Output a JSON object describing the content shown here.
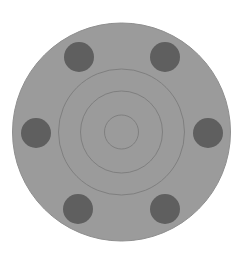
{
  "diagram": {
    "canvas": {
      "width": 243,
      "height": 258,
      "background": "#ffffff"
    },
    "disc": {
      "cx": 121.5,
      "cy": 132,
      "r": 109,
      "fill": "#9b9b9b",
      "stroke": "#8f8f8f"
    },
    "rings": [
      {
        "name": "outer",
        "r": 63
      },
      {
        "name": "middle",
        "r": 41
      },
      {
        "name": "inner",
        "r": 17
      }
    ],
    "ring_color": "#7c7c7c",
    "holes": [
      {
        "name": "top-left",
        "cx": 79,
        "cy": 57,
        "r": 15
      },
      {
        "name": "top-right",
        "cx": 165,
        "cy": 57,
        "r": 15
      },
      {
        "name": "left",
        "cx": 36,
        "cy": 133,
        "r": 15
      },
      {
        "name": "right",
        "cx": 208,
        "cy": 133,
        "r": 15
      },
      {
        "name": "bottom-left",
        "cx": 78,
        "cy": 209,
        "r": 15
      },
      {
        "name": "bottom-right",
        "cx": 165,
        "cy": 209,
        "r": 15
      }
    ],
    "hole_color": "#5f5f5f"
  }
}
